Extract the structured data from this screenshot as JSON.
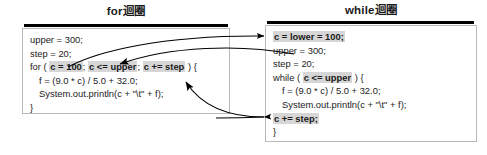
{
  "page": {
    "background": "#ffffff",
    "width": 487,
    "height": 155
  },
  "panels": {
    "left": {
      "title": "for迴圈",
      "code_lines": [
        {
          "indent": 0,
          "segments": [
            {
              "text": "upper = 300;",
              "highlight": false
            }
          ]
        },
        {
          "indent": 0,
          "segments": [
            {
              "text": "step = 20;",
              "highlight": false
            }
          ]
        },
        {
          "indent": 0,
          "segments": [
            {
              "text": "for ( ",
              "highlight": false
            },
            {
              "text": "c = 100",
              "highlight": true
            },
            {
              "text": "; ",
              "highlight": false
            },
            {
              "text": "c <= upper",
              "highlight": true
            },
            {
              "text": "; ",
              "highlight": false
            },
            {
              "text": "c += step",
              "highlight": true
            },
            {
              "text": " ) {",
              "highlight": false
            }
          ]
        },
        {
          "indent": 1,
          "segments": [
            {
              "text": "f = (9.0 * c) / 5.0 + 32.0;",
              "highlight": false
            }
          ]
        },
        {
          "indent": 1,
          "segments": [
            {
              "text": "System.out.println(c + \"\\t\" + f);",
              "highlight": false
            }
          ]
        },
        {
          "indent": 0,
          "segments": [
            {
              "text": "}",
              "highlight": false
            }
          ]
        }
      ]
    },
    "right": {
      "title": "while迴圈",
      "code_lines": [
        {
          "indent": 0,
          "segments": [
            {
              "text": "c = lower = 100;",
              "highlight": true
            }
          ]
        },
        {
          "indent": 0,
          "segments": [
            {
              "text": "upper = 300;",
              "highlight": false
            }
          ]
        },
        {
          "indent": 0,
          "segments": [
            {
              "text": "step = 20;",
              "highlight": false
            }
          ]
        },
        {
          "indent": 0,
          "segments": [
            {
              "text": "while ( ",
              "highlight": false
            },
            {
              "text": "c <= upper",
              "highlight": true
            },
            {
              "text": " ) {",
              "highlight": false
            }
          ]
        },
        {
          "indent": 1,
          "segments": [
            {
              "text": "f = (9.0 * c) / 5.0 + 32.0;",
              "highlight": false
            }
          ]
        },
        {
          "indent": 1,
          "segments": [
            {
              "text": "System.out.println(c + \"\\t\" + f);",
              "highlight": false
            }
          ]
        },
        {
          "indent": 0,
          "segments": [
            {
              "text": "c += step;",
              "highlight": true
            }
          ]
        },
        {
          "indent": 0,
          "segments": [
            {
              "text": "}",
              "highlight": false
            }
          ]
        }
      ]
    }
  },
  "connectors": [
    {
      "name": "init-connector",
      "from": "for-init",
      "to": "while-init"
    },
    {
      "name": "condition-connector",
      "from": "for-condition",
      "to": "while-condition"
    },
    {
      "name": "update-connector",
      "from": "for-update",
      "to": "while-update"
    }
  ],
  "colors": {
    "highlight": "#d6d6d6",
    "rule": "#000000",
    "box_border": "#b9b9b9",
    "text": "#1b1b1b",
    "arrow": "#000000"
  }
}
